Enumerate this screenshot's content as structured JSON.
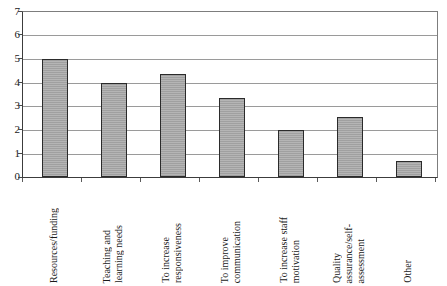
{
  "chart_data": {
    "type": "bar",
    "title": "",
    "subtitle": "",
    "xlabel": "",
    "ylabel": "",
    "ylim": [
      0,
      7
    ],
    "ytick_labels": [
      "0",
      "1",
      "2",
      "3",
      "4",
      "5",
      "6",
      "7"
    ],
    "ytick_values": [
      0,
      1,
      2,
      3,
      4,
      5,
      6,
      7
    ],
    "grid": true,
    "legend": false,
    "legend_position": "none",
    "categories": [
      "Resources/funding",
      "Teaching and learning needs",
      "To increase responsiveness",
      "To improve communication",
      "To increase staff motivation",
      "Quality assurance/self-assessment",
      "Other"
    ],
    "category_label_lines": [
      [
        "Resources/funding"
      ],
      [
        "Teaching and",
        "learning needs"
      ],
      [
        "To increase",
        "responsiveness"
      ],
      [
        "To improve",
        "communication"
      ],
      [
        "To increase staff",
        "motivation"
      ],
      [
        "Quality",
        "assurance/self-",
        "assessment"
      ],
      [
        "Other"
      ]
    ],
    "values": [
      5.0,
      4.0,
      4.35,
      3.35,
      2.0,
      2.55,
      0.7
    ],
    "bar_fill_color": "#a9a9a9",
    "bar_border_color": "#2b2b2b",
    "gridline_color": "#9a9a9a",
    "axis_color": "#3c3c3c",
    "background_color": "#ffffff"
  }
}
